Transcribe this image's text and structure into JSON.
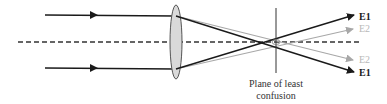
{
  "diagram": {
    "labels": {
      "e1_top": "E1",
      "e2_top": "E2",
      "e2_bottom": "E2",
      "e1_bottom": "E1"
    },
    "caption_line1": "Plane of least",
    "caption_line2": "confusion",
    "colors": {
      "edge_ray": "#1a1a1a",
      "paraxial_ray": "#a8a8a8",
      "lens_fill": "#d9d9d9",
      "lens_stroke": "#555555",
      "axis": "#333333",
      "plane": "#333333"
    },
    "elements": [
      "incident-ray-top",
      "incident-ray-bottom",
      "optical-axis",
      "convex-lens",
      "plane-of-least-confusion"
    ]
  }
}
